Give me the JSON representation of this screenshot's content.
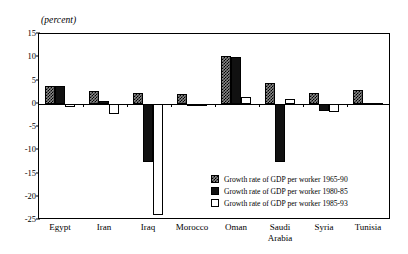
{
  "chart_data": {
    "type": "bar",
    "title": "",
    "units_label": "(percent)",
    "xlabel": "",
    "ylabel": "",
    "ylim": [
      -25,
      15
    ],
    "yticks": [
      15,
      10,
      5,
      0,
      -5,
      -10,
      -15,
      -20,
      -25
    ],
    "ytick_labels": [
      "15",
      "10",
      "5",
      "0",
      "-5",
      "-10",
      "-15",
      "-20",
      "-25"
    ],
    "grid": false,
    "legend_position": "inside-lower-right",
    "categories": [
      "Egypt",
      "Iran",
      "Iraq",
      "Morocco",
      "Oman",
      "Saudi Arabia",
      "Syria",
      "Tunisia"
    ],
    "category_labels": [
      "Egypt",
      "Iran",
      "Iraq",
      "Morocco",
      "Oman",
      "Saudi\nArabia",
      "Syria",
      "Tunisia"
    ],
    "series": [
      {
        "name": "Growth rate of GDP per worker 1965-90",
        "style": "checkered-gray",
        "values": [
          3.8,
          2.7,
          2.4,
          2.0,
          10.2,
          4.4,
          2.4,
          3.0
        ]
      },
      {
        "name": "Growth rate of GDP per worker 1980-85",
        "style": "solid-black",
        "values": [
          3.8,
          0.5,
          -12.5,
          -0.3,
          10.0,
          -12.5,
          -1.5,
          0.2
        ]
      },
      {
        "name": "Growth rate of GDP per worker 1985-93",
        "style": "white-outline",
        "values": [
          -0.6,
          -2.3,
          -24.0,
          0.0,
          1.5,
          1.0,
          -1.7,
          0.2
        ]
      }
    ]
  },
  "legend": {
    "entries": [
      "Growth rate of GDP per worker 1965-90",
      "Growth rate of GDP per worker 1980-85",
      "Growth rate of GDP per worker 1985-93"
    ]
  },
  "colors": {
    "axis": "#000000",
    "series_1965_90": "#8a8a8a",
    "series_1980_85": "#111111",
    "series_1985_93": "#ffffff",
    "background": "#ffffff"
  }
}
